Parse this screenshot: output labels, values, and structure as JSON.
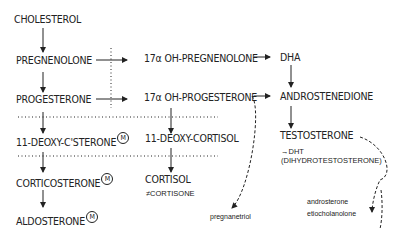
{
  "nodes": {
    "cholesterol": "CHOLESTEROL",
    "pregnenolone": "PREGNENOLONE",
    "progesterone": "PROGESTERONE",
    "oh_pregnenolone": "17α OH-PREGNENOLONE",
    "oh_progesterone": "17α OH-PROGESTERONE",
    "dha": "DHA",
    "androstenedione": "ANDROSTENEDIONE",
    "deoxy_csterone": "11-DEOXY-C'STERONE",
    "deoxy_cortisol": "11-DEOXY-CORTISOL",
    "corticosterone": "CORTICOSTERONE",
    "cortisol": "CORTISOL",
    "cortisone": "≠CORTISONE",
    "aldosterone": "ALDOSTERONE",
    "testosterone": "TESTOSTERONE",
    "dht": "→DHT",
    "dht_full": "(DIHYDROTESTOSTERONE)",
    "pregnanetriol": "pregnanetriol",
    "androsterone": "androsterone",
    "etiocholanolone": "etiocholanolone"
  },
  "markers": {
    "m": "M"
  }
}
